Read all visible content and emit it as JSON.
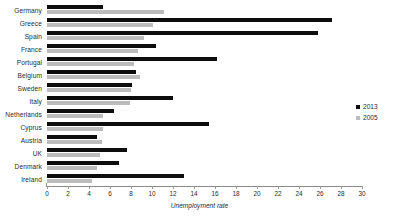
{
  "chart_data": {
    "type": "bar",
    "orientation": "horizontal",
    "title": "",
    "xlabel": "Unemployment rate",
    "ylabel": "",
    "xlim": [
      0,
      30
    ],
    "xticks": [
      0,
      2,
      4,
      6,
      8,
      10,
      12,
      14,
      16,
      18,
      20,
      22,
      24,
      26,
      28,
      30
    ],
    "grid": false,
    "legend_position": "right",
    "categories": [
      "Germany",
      "Greece",
      "Spain",
      "France",
      "Portugal",
      "Belgium",
      "Sweden",
      "Italy",
      "Netherlands",
      "Cyprus",
      "Austria",
      "UK",
      "Denmark",
      "Ireland"
    ],
    "series": [
      {
        "name": "2013",
        "color": "#0d0d0d",
        "values": [
          5.3,
          27.1,
          25.8,
          10.4,
          16.2,
          8.5,
          8.1,
          12.0,
          6.4,
          15.4,
          4.8,
          7.6,
          6.9,
          13.0
        ]
      },
      {
        "name": "2005",
        "color": "#bcbcbc",
        "values": [
          11.1,
          10.1,
          9.2,
          8.7,
          8.3,
          8.9,
          8.0,
          7.9,
          5.3,
          5.3,
          5.2,
          5.0,
          4.8,
          4.3
        ]
      }
    ]
  }
}
